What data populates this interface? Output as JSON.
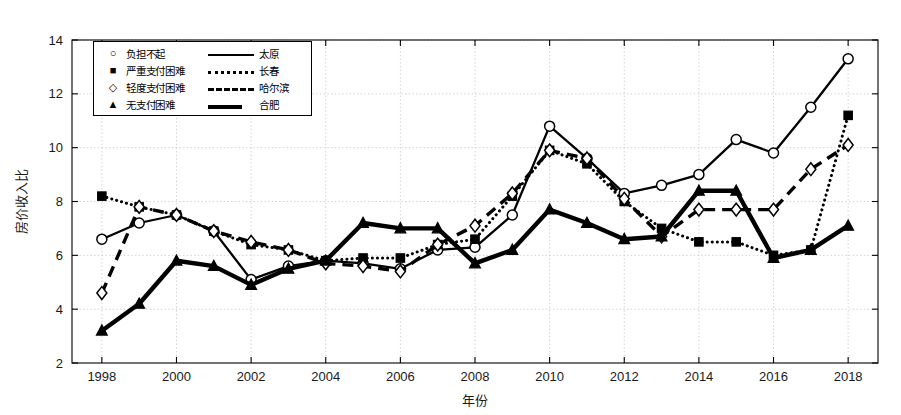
{
  "chart_data": {
    "type": "line",
    "title": "",
    "xlabel": "年份",
    "ylabel": "房价收入比",
    "xlim": [
      1997.2,
      2018.8
    ],
    "ylim": [
      2,
      14
    ],
    "xticks": [
      1998,
      2000,
      2002,
      2004,
      2006,
      2008,
      2010,
      2012,
      2014,
      2016,
      2018
    ],
    "yticks": [
      2,
      4,
      6,
      8,
      10,
      12,
      14
    ],
    "grid": true,
    "legend_position": "upper-left",
    "x": [
      1998,
      1999,
      2000,
      2001,
      2002,
      2003,
      2004,
      2005,
      2006,
      2007,
      2008,
      2009,
      2010,
      2011,
      2012,
      2013,
      2014,
      2015,
      2016,
      2017,
      2018
    ],
    "series": [
      {
        "name": "太原",
        "linestyle": "solid",
        "marker": "circle",
        "values": [
          6.6,
          7.2,
          7.5,
          6.9,
          5.1,
          5.6,
          5.8,
          5.7,
          5.5,
          6.2,
          6.3,
          7.5,
          10.8,
          9.6,
          8.3,
          8.6,
          9.0,
          10.3,
          9.8,
          11.5,
          13.3
        ]
      },
      {
        "name": "长春",
        "linestyle": "dotted",
        "marker": "square",
        "values": [
          8.2,
          7.8,
          7.5,
          6.9,
          6.4,
          6.2,
          5.8,
          5.9,
          5.9,
          6.4,
          6.6,
          8.2,
          9.9,
          9.4,
          8.0,
          7.0,
          6.5,
          6.5,
          6.0,
          6.2,
          11.2
        ]
      },
      {
        "name": "哈尔滨",
        "linestyle": "dashed",
        "marker": "diamond",
        "values": [
          4.6,
          7.8,
          7.5,
          6.9,
          6.5,
          6.2,
          5.7,
          5.6,
          5.4,
          6.4,
          7.1,
          8.3,
          9.9,
          9.6,
          8.1,
          6.7,
          7.7,
          7.7,
          7.7,
          9.2,
          10.1
        ]
      },
      {
        "name": "合肥",
        "linestyle": "thick-solid",
        "marker": "triangle",
        "values": [
          3.2,
          4.2,
          5.8,
          5.6,
          4.9,
          5.5,
          5.8,
          7.2,
          7.0,
          7.0,
          5.7,
          6.2,
          7.7,
          7.2,
          6.6,
          6.7,
          8.4,
          8.4,
          5.9,
          6.2,
          7.1
        ]
      }
    ]
  },
  "legend": {
    "rows": [
      {
        "marker": "○",
        "category": "负担不起",
        "linestyle": "solid",
        "city": "太原"
      },
      {
        "marker": "■",
        "category": "严重支付困难",
        "linestyle": "dotted",
        "city": "长春"
      },
      {
        "marker": "◇",
        "category": "轻度支付困难",
        "linestyle": "dashed",
        "city": "哈尔滨"
      },
      {
        "marker": "▲",
        "category": "无支付困难",
        "linestyle": "thick",
        "city": "合肥"
      }
    ]
  },
  "axes": {
    "x_title": "年份",
    "y_title": "房价收入比",
    "x_tick_labels": [
      "1998",
      "2000",
      "2002",
      "2004",
      "2006",
      "2008",
      "2010",
      "2012",
      "2014",
      "2016",
      "2018"
    ],
    "y_tick_labels": [
      "2",
      "4",
      "6",
      "8",
      "10",
      "12",
      "14"
    ]
  },
  "colors": {
    "line": "#000000",
    "grid": "#c8c8c8",
    "axis": "#000000",
    "background": "#ffffff"
  }
}
